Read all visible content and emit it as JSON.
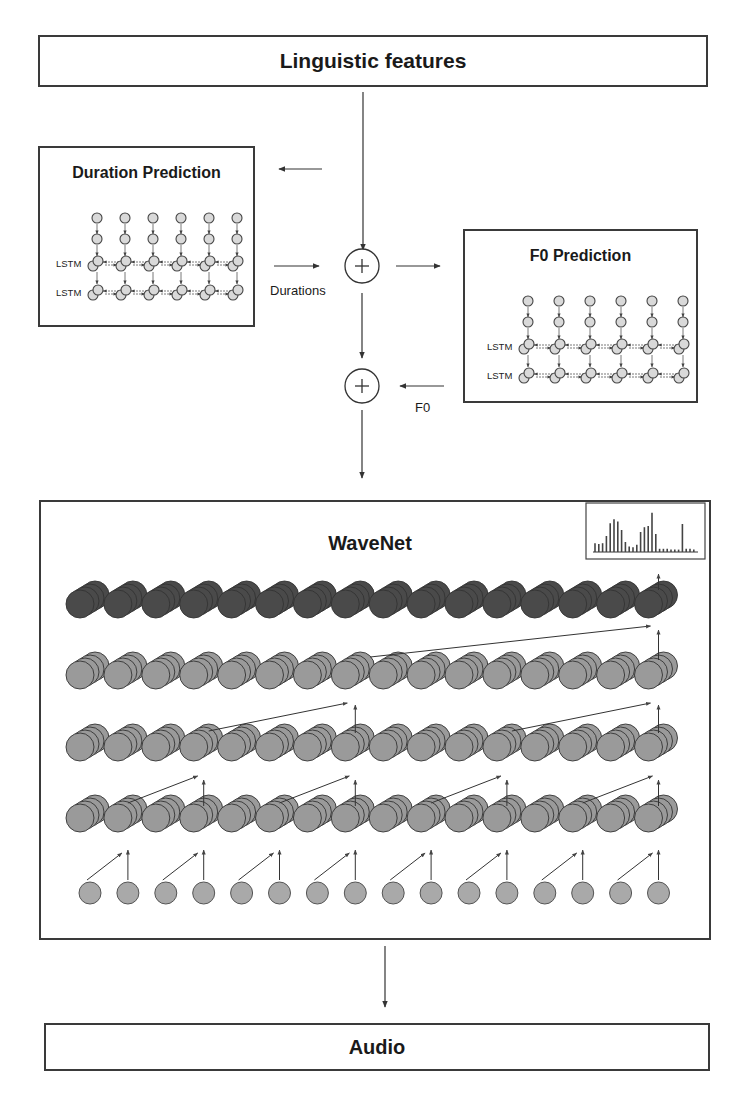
{
  "diagram": {
    "nodes": {
      "linguistic_features": {
        "label": "Linguistic features"
      },
      "duration_prediction": {
        "label": "Duration Prediction",
        "layers": [
          "LSTM",
          "LSTM"
        ],
        "timesteps": 6
      },
      "f0_prediction": {
        "label": "F0 Prediction",
        "layers": [
          "LSTM",
          "LSTM"
        ],
        "timesteps": 6
      },
      "sum_1": {
        "symbol": "+"
      },
      "sum_2": {
        "symbol": "+"
      },
      "wavenet": {
        "label": "WaveNet",
        "stack_rows": 4,
        "stacks_per_row": 16,
        "input_nodes": 16
      },
      "audio": {
        "label": "Audio"
      }
    },
    "edges": [
      {
        "from": "linguistic_features",
        "to": "sum_1",
        "label": ""
      },
      {
        "from": "linguistic_features",
        "to": "duration_prediction",
        "label": ""
      },
      {
        "from": "duration_prediction",
        "to": "sum_1",
        "label": "Durations"
      },
      {
        "from": "sum_1",
        "to": "f0_prediction",
        "label": ""
      },
      {
        "from": "sum_1",
        "to": "sum_2",
        "label": ""
      },
      {
        "from": "f0_prediction",
        "to": "sum_2",
        "label": "F0"
      },
      {
        "from": "sum_2",
        "to": "wavenet",
        "label": ""
      },
      {
        "from": "wavenet",
        "to": "audio",
        "label": ""
      }
    ],
    "edge_labels": {
      "durations": "Durations",
      "f0": "F0"
    },
    "output_histogram": {
      "bars": [
        0.22,
        0.2,
        0.22,
        0.4,
        0.72,
        0.82,
        0.76,
        0.55,
        0.25,
        0.14,
        0.12,
        0.18,
        0.5,
        0.62,
        0.65,
        0.98,
        0.45,
        0.08,
        0.08,
        0.08,
        0.06,
        0.06,
        0.06,
        0.7,
        0.08,
        0.08,
        0.06
      ]
    }
  }
}
